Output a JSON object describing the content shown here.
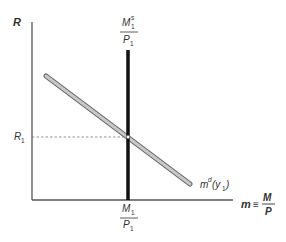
{
  "diagram": {
    "y_axis_label": "R",
    "x_axis_label": {
      "lhs": "m",
      "equiv": "≡",
      "numerator": "M",
      "denominator": "P"
    },
    "supply_label": {
      "numerator": "M",
      "numerator_sub": "1",
      "numerator_sup": "s",
      "denominator": "P",
      "denominator_sub": "1"
    },
    "x_tick_label": {
      "numerator": "M",
      "numerator_sub": "1",
      "denominator": "P",
      "denominator_sub": "1"
    },
    "y_tick_label": {
      "base": "R",
      "sub": "1"
    },
    "demand_label": {
      "base": "m",
      "sup": "d",
      "arg_open": "(y",
      "arg_sub": "1",
      "arg_close": ")"
    },
    "colors": {
      "axis": "#555555",
      "supply": "#111111",
      "demand_fill": "#c8c8c8",
      "demand_outline": "#666666",
      "guide": "#777777"
    }
  }
}
